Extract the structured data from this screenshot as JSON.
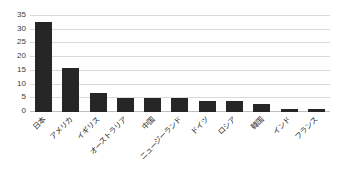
{
  "chart_data": {
    "type": "bar",
    "title": "",
    "xlabel": "",
    "ylabel": "",
    "categories": [
      "日本",
      "アメリカ",
      "イギリス",
      "オーストラリア",
      "中国",
      "ニュージーランド",
      "ドイツ",
      "ロシア",
      "韓国",
      "インド",
      "フランス"
    ],
    "values": [
      33,
      16,
      7,
      5,
      5,
      5,
      4,
      4,
      3,
      1,
      1
    ],
    "ylim": [
      0,
      35
    ],
    "yticks": [
      0,
      5,
      10,
      15,
      20,
      25,
      30,
      35
    ],
    "ytick_labels": [
      "0",
      "5",
      "10",
      "15",
      "20",
      "25",
      "30",
      "35"
    ],
    "grid": true,
    "legend": false,
    "bar_color": "#262626",
    "gridline_color": "#d9d9d9",
    "background_color": "#ffffff"
  }
}
